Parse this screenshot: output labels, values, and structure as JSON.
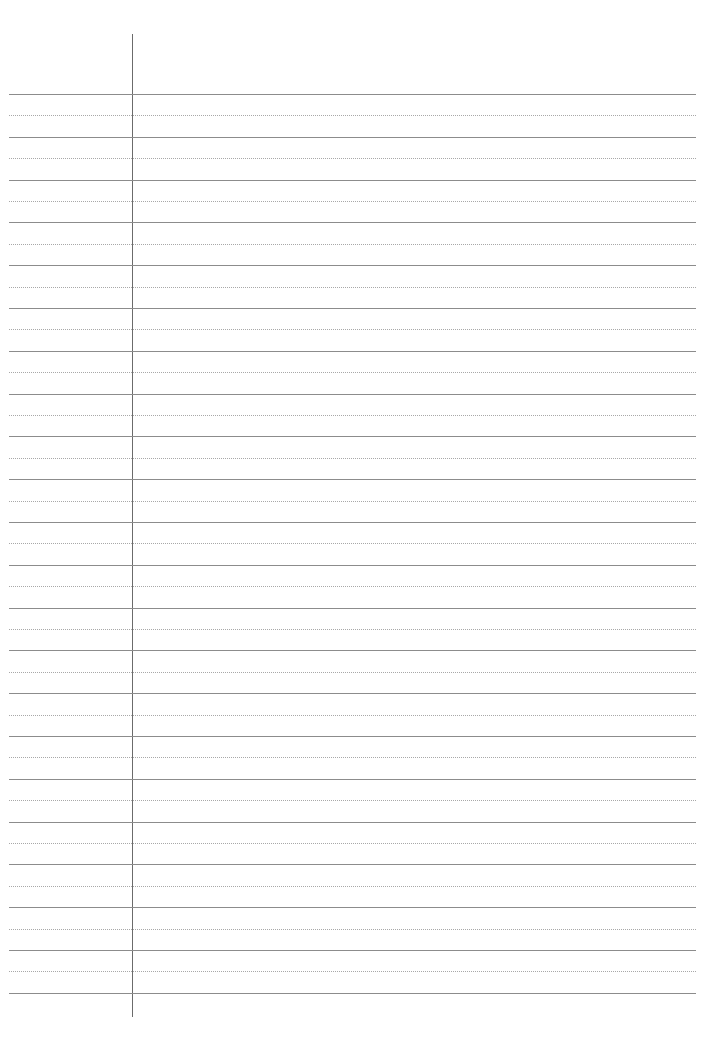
{
  "page": {
    "type": "lined-paper",
    "background_color": "#ffffff",
    "line_color": "#8c8c8c",
    "dotted_line_color": "#a8a8a8",
    "margin_line_color": "#6b6b6b",
    "margin_line_x": 132,
    "margin_line_top": 34,
    "margin_line_bottom": 1017,
    "first_solid_line_y": 94,
    "line_pitch": 42.8,
    "solid_line_count": 22,
    "dotted_line_count": 21,
    "left": 9,
    "right": 696
  }
}
